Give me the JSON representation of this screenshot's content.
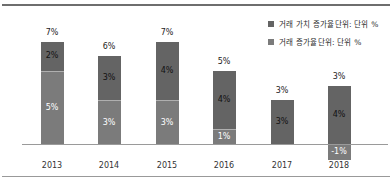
{
  "chart_data": {
    "type": "bar",
    "stacked": true,
    "title": "",
    "unit": "%",
    "grid": false,
    "legend_position": "top-right",
    "categories": [
      "2013",
      "2014",
      "2015",
      "2016",
      "2017",
      "2018"
    ],
    "series": [
      {
        "name": "거래 가치 증가율단위: 단위 %",
        "color": "#646464",
        "label_color": "#111111",
        "values": [
          2,
          3,
          4,
          4,
          3,
          4
        ],
        "labels": [
          "2%",
          "3%",
          "4%",
          "4%",
          "3%",
          "4%"
        ]
      },
      {
        "name": "거래 증가율단위: 단위 %",
        "color": "#7b7b7b",
        "label_color": "#ffffff",
        "values": [
          5,
          3,
          3,
          1,
          0,
          -1
        ],
        "labels": [
          "5%",
          "3%",
          "3%",
          "1%",
          "",
          "-1%"
        ]
      }
    ],
    "totals": [
      "7%",
      "6%",
      "7%",
      "5%",
      "3%",
      "3%"
    ],
    "ylim": [
      -1.5,
      8
    ]
  },
  "frame": {
    "background": "#ffffff",
    "top_rule_color": "#6e6e6e",
    "bottom_rule_color": "#999999",
    "axis_color": "#9a9a9a"
  }
}
